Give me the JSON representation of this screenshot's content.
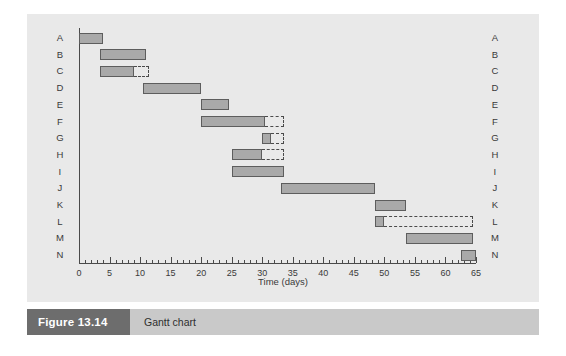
{
  "figure": {
    "caption_number": "Figure 13.14",
    "caption_title": "Gantt chart",
    "number_box_color": "#6d6d6d",
    "title_box_color": "#c9c9c9",
    "panel_background": "#e9e9e9"
  },
  "chart_data": {
    "type": "bar",
    "orientation": "horizontal",
    "title": "Gantt chart",
    "xlabel": "Time (days)",
    "ylabel": "",
    "xlim": [
      0,
      65
    ],
    "xtick_step": 5,
    "xtick_minor_step": 1,
    "grid": false,
    "legend": "none",
    "bar_color": "#a9a9a9",
    "bar_border_color": "#5d5d5d",
    "float_border_color": "#4a4a4a",
    "xticks": [
      0,
      5,
      10,
      15,
      20,
      25,
      30,
      35,
      40,
      45,
      50,
      55,
      60,
      65
    ],
    "categories": [
      "A",
      "B",
      "C",
      "D",
      "E",
      "F",
      "G",
      "H",
      "I",
      "J",
      "K",
      "L",
      "M",
      "N"
    ],
    "left_axis_labels": [
      "A",
      "B",
      "C",
      "D",
      "E",
      "F",
      "G",
      "H",
      "I",
      "J",
      "K",
      "L",
      "M",
      "N"
    ],
    "right_axis_labels": [
      "A",
      "B",
      "C",
      "D",
      "E",
      "F",
      "G",
      "H",
      "I",
      "J",
      "K",
      "L",
      "M",
      "N"
    ],
    "tasks": [
      {
        "id": "A",
        "start": 0,
        "end": 4,
        "float_end": 4
      },
      {
        "id": "B",
        "start": 3.5,
        "end": 11,
        "float_end": 11
      },
      {
        "id": "C",
        "start": 3.5,
        "end": 9,
        "float_end": 11.5
      },
      {
        "id": "D",
        "start": 10.5,
        "end": 20,
        "float_end": 20
      },
      {
        "id": "E",
        "start": 20,
        "end": 24.5,
        "float_end": 24.5
      },
      {
        "id": "F",
        "start": 20,
        "end": 30.5,
        "float_end": 33.5
      },
      {
        "id": "G",
        "start": 30,
        "end": 31.5,
        "float_end": 33.5
      },
      {
        "id": "H",
        "start": 25,
        "end": 30,
        "float_end": 33.5
      },
      {
        "id": "I",
        "start": 25,
        "end": 33.5,
        "float_end": 33.5
      },
      {
        "id": "J",
        "start": 33,
        "end": 48.5,
        "float_end": 48.5
      },
      {
        "id": "K",
        "start": 48.5,
        "end": 53.5,
        "float_end": 53.5
      },
      {
        "id": "L",
        "start": 48.5,
        "end": 50,
        "float_end": 64.5
      },
      {
        "id": "M",
        "start": 53.5,
        "end": 64.5,
        "float_end": 64.5
      },
      {
        "id": "N",
        "start": 62.5,
        "end": 65,
        "float_end": 65
      }
    ]
  }
}
